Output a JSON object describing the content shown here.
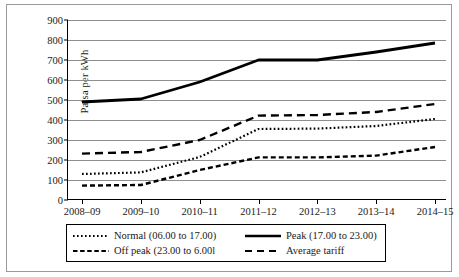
{
  "chart_data": {
    "type": "line",
    "title": "",
    "xlabel": "",
    "ylabel": "Paisa per kWh",
    "categories": [
      "2008–09",
      "2009–10",
      "2010–11",
      "2011–12",
      "2012–13",
      "2013–14",
      "2014–15"
    ],
    "ylim": [
      0,
      900
    ],
    "ytick_step": 100,
    "yticks": [
      0,
      100,
      200,
      300,
      400,
      500,
      600,
      700,
      800,
      900
    ],
    "grid": true,
    "legend_position": "bottom",
    "series": [
      {
        "name": "Normal (06.00 to 17.00)",
        "style": "dotted",
        "color": "#000000",
        "values": [
          130,
          138,
          215,
          355,
          357,
          370,
          405
        ]
      },
      {
        "name": "Peak (17.00 to 23.00)",
        "style": "solid",
        "color": "#000000",
        "values": [
          490,
          505,
          590,
          700,
          700,
          740,
          785
        ]
      },
      {
        "name": "Off peak (23.00 to 6.00l",
        "style": "dashed",
        "color": "#000000",
        "values": [
          72,
          75,
          150,
          213,
          213,
          222,
          265
        ]
      },
      {
        "name": "Average tariff",
        "style": "long-dash",
        "color": "#000000",
        "values": [
          232,
          240,
          300,
          422,
          425,
          440,
          480
        ]
      }
    ]
  },
  "legend": {
    "entries": [
      {
        "label": "Normal (06.00 to 17.00)",
        "marker": "dotted-line-icon"
      },
      {
        "label": "Peak (17.00 to 23.00)",
        "marker": "solid-line-icon"
      },
      {
        "label": "Off peak (23.00 to 6.00l",
        "marker": "dashed-line-icon"
      },
      {
        "label": "Average tariff",
        "marker": "long-dash-line-icon"
      }
    ]
  }
}
